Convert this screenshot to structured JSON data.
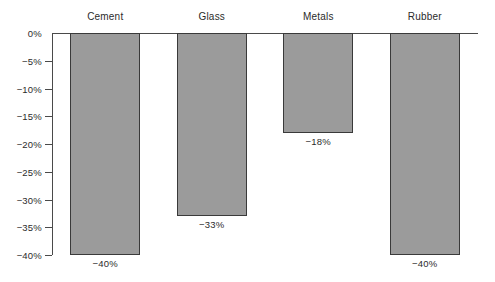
{
  "chart_data": {
    "type": "bar",
    "title": "",
    "subtitle": "",
    "xlabel": "",
    "ylabel": "",
    "categories": [
      "Cement",
      "Glass",
      "Metals",
      "Rubber"
    ],
    "values": [
      -40,
      -33,
      -18,
      -40
    ],
    "value_labels": [
      "−40%",
      "−33%",
      "−18%",
      "−40%"
    ],
    "ylim": [
      -40,
      0
    ],
    "yticks": [
      0,
      -5,
      -10,
      -15,
      -20,
      -25,
      -30,
      -35,
      -40
    ],
    "ytick_labels": [
      "0%",
      "−5%",
      "−10%",
      "−15%",
      "−20%",
      "−25%",
      "−30%",
      "−35%",
      "−40%"
    ],
    "grid": false,
    "legend": null,
    "legend_position": "none",
    "orientation": "vertical",
    "bar_color": "#9b9b9b",
    "bar_border_color": "#3a3a3a",
    "axis_color": "#4a4a4a",
    "text_color": "#2b2b2b",
    "background_color": "#ffffff",
    "category_label_position": "top",
    "value_label_position": "below-bar-end"
  }
}
